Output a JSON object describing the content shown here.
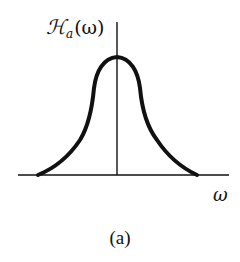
{
  "figure": {
    "y_axis_label": {
      "symbol": "ℋ",
      "subscript": "a",
      "argument": "(ω)"
    },
    "x_axis_label": "ω",
    "caption": "(a)"
  },
  "colors": {
    "background": "#ffffff",
    "ink": "#111111"
  }
}
